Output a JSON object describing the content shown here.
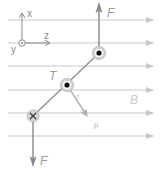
{
  "diagram": {
    "type": "physics-magnetic-torque-on-current-loop",
    "colors": {
      "field_line": "#c8c8c8",
      "wire": "#8a8a8a",
      "force_arrow": "#888888",
      "label": "#9a9a9a",
      "conductor_ring": "#bdbdbd",
      "conductor_dot": "#111111"
    },
    "axes": {
      "x_label": "x",
      "y_label": "y",
      "z_label": "z",
      "y_direction": "out-of-page"
    },
    "field": {
      "label": "B",
      "direction": "+z",
      "line_count": 6
    },
    "conductors": [
      {
        "name": "top",
        "symbol": "dot",
        "meaning": "current out of page"
      },
      {
        "name": "center",
        "symbol": "dot",
        "meaning": "axis of rotation"
      },
      {
        "name": "bottom",
        "symbol": "cross",
        "meaning": "current into page"
      }
    ],
    "forces": [
      {
        "label": "F",
        "direction": "up"
      },
      {
        "label": "F",
        "direction": "down"
      }
    ],
    "torque_label": "T",
    "moment_label": "μ",
    "angle_label": "θ"
  }
}
